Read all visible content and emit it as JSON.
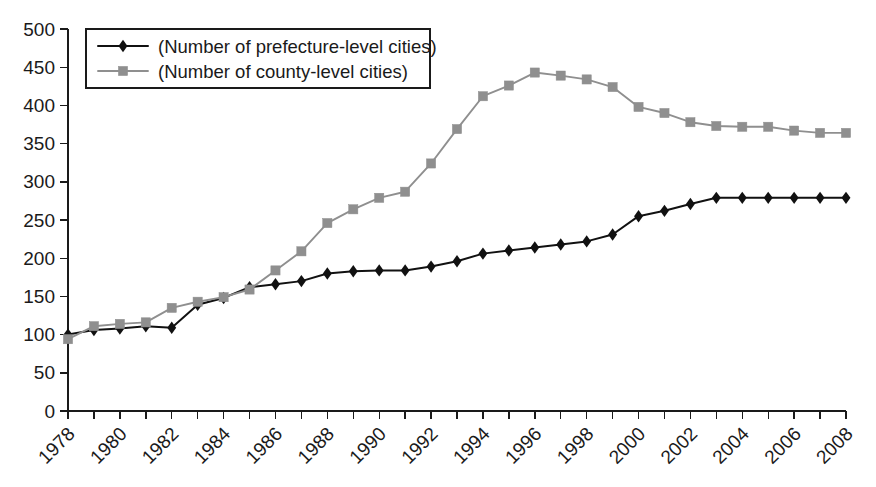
{
  "chart_data": {
    "type": "line",
    "title": "",
    "subtitle": "",
    "xlabel": "",
    "ylabel": "",
    "grid": false,
    "legend_position": "top-left",
    "ylim": [
      0,
      500
    ],
    "ytick_step": 50,
    "yticks": [
      "0",
      "50",
      "100",
      "150",
      "200",
      "250",
      "300",
      "350",
      "400",
      "450",
      "500"
    ],
    "xlim": [
      1978,
      2008
    ],
    "xtick_step": 2,
    "xticks": [
      "1978",
      "1980",
      "1982",
      "1984",
      "1986",
      "1988",
      "1990",
      "1992",
      "1994",
      "1996",
      "1998",
      "2000",
      "2002",
      "2004",
      "2006",
      "2008"
    ],
    "xtick_rotation": -45,
    "x": [
      1978,
      1979,
      1980,
      1981,
      1982,
      1983,
      1984,
      1985,
      1986,
      1987,
      1988,
      1989,
      1990,
      1991,
      1992,
      1993,
      1994,
      1995,
      1996,
      1997,
      1998,
      1999,
      2000,
      2001,
      2002,
      2003,
      2004,
      2005,
      2006,
      2007,
      2008
    ],
    "series": [
      {
        "name": "(Number of prefecture-level cities)",
        "color": "#111111",
        "marker": "diamond",
        "values": [
          100,
          106,
          108,
          111,
          109,
          139,
          148,
          162,
          166,
          170,
          180,
          183,
          184,
          184,
          189,
          196,
          206,
          210,
          214,
          218,
          222,
          231,
          255,
          262,
          271,
          279,
          279,
          279,
          279,
          279,
          279
        ]
      },
      {
        "name": "(Number of county-level cities)",
        "color": "#8f8f8f",
        "marker": "square",
        "values": [
          94,
          111,
          114,
          116,
          135,
          143,
          149,
          159,
          184,
          209,
          246,
          264,
          279,
          287,
          324,
          369,
          412,
          426,
          443,
          439,
          434,
          424,
          398,
          390,
          378,
          373,
          372,
          372,
          367,
          364,
          364
        ]
      }
    ],
    "legend": [
      "(Number of prefecture-level cities)",
      "(Number of county-level cities)"
    ]
  },
  "colors": {
    "axis": "#1a1a1a",
    "series_a": "#111111",
    "series_b": "#8f8f8f",
    "background": "#ffffff"
  }
}
